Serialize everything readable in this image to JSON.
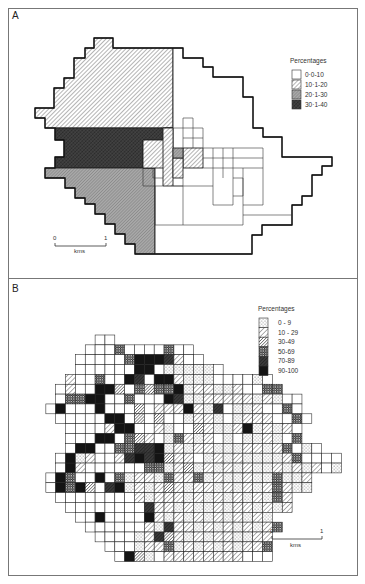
{
  "figure": {
    "panel_a": {
      "label": "A",
      "legend": {
        "title": "Percentages",
        "items": [
          {
            "label": "0·0-10",
            "pattern": "white"
          },
          {
            "label": "10·1-20",
            "pattern": "hatch-light"
          },
          {
            "label": "20·1-30",
            "pattern": "gray"
          },
          {
            "label": "30·1-40",
            "pattern": "dark"
          }
        ]
      },
      "scale": {
        "start": "0",
        "end": "1",
        "unit": "kms"
      },
      "regions": [
        {
          "class": "hatch-light",
          "points": "94,38 113,38 113,48 173,48 173,128 45,128 45,118 35,118 35,108 54,108 54,88 64,88 64,78 74,78 74,58 85,58 85,48 94,48"
        },
        {
          "class": "dark",
          "points": "55,128 165,128 165,168 55,168 55,157 64,157 64,140 55,140"
        },
        {
          "class": "gray",
          "points": "45,168 155,168 155,254 135,254 135,244 125,244 125,234 115,234 115,224 105,224 105,214 95,214 95,204 85,204 85,198 75,198 75,188 65,188 65,178 55,178 55,178 45,178"
        },
        {
          "class": "white",
          "points": "173,48 183,48 183,58 203,58 203,67 213,67 213,77 243,77 243,97 253,97 253,128 263,128 263,137 282,137 282,157 332,157 332,166 322,166 322,175 312,175 312,196 302,196 302,205 292,205 292,225 262,225 262,235 252,235 252,254 155,254 155,168 143,168 143,140 165,140 165,128 173,128"
        },
        {
          "class": "hatch-light",
          "points": "143,140 165,140 165,128 173,128 173,168 143,168"
        },
        {
          "class": "hatch-light",
          "points": "163,128 173,128 173,186 163,186"
        },
        {
          "class": "hatch-light",
          "points": "183,148 203,148 203,168 183,168"
        },
        {
          "class": "hatch-light",
          "points": "173,158 183,158 183,178 173,178"
        },
        {
          "class": "gray",
          "points": "173,148 183,148 183,158 173,158"
        }
      ],
      "lines": [
        "183,118 183,148",
        "183,118 193,118 193,148",
        "173,128 203,128",
        "183,138 203,138",
        "203,128 203,148",
        "203,148 263,148",
        "203,158 263,158",
        "203,168 213,168",
        "213,148 213,168",
        "223,148 223,178",
        "233,148 233,205",
        "263,148 263,205",
        "213,168 263,168",
        "143,168 143,186 163,186",
        "153,168 153,178 163,178",
        "183,178 183,186 173,186",
        "173,186 213,186",
        "213,168 213,205 233,205",
        "233,178 243,178 243,196 233,196",
        "243,168 243,205 263,205",
        "155,186 155,225",
        "183,186 183,225",
        "155,225 243,225",
        "243,205 243,225",
        "243,215 292,215",
        "155,254 252,254"
      ]
    },
    "panel_b": {
      "label": "B",
      "legend": {
        "title": "Percentages",
        "items": [
          {
            "label": "0 - 9",
            "code": 1
          },
          {
            "label": "10 - 29",
            "code": 2
          },
          {
            "label": "30-49",
            "code": 3
          },
          {
            "label": "50-69",
            "code": 4
          },
          {
            "label": "70-89",
            "code": 5
          },
          {
            "label": "90-100",
            "code": 6
          }
        ]
      },
      "scale": {
        "start": "0",
        "end": "1",
        "unit": "kms"
      },
      "grid": {
        "origin_x": 36,
        "origin_y": 335,
        "cell": 9.85,
        "rows": [
          "......00......................",
          ".....00040000400..............",
          "....0000046665200.............",
          "....000000660111110...........",
          "...200400650662111000010......",
          "..02006630434461221120044.....",
          "..0446600400065112222212100...",
          ".06000600030222621501120040...",
          "..00000660303001221012220040..",
          "...000026600210032112612120...",
          "...000660432014212010112104...",
          "...06600445561212211122124010.",
          "..06120025656322012121111240000",
          "..06200000044123121212112121201",
          ".064006041221422412112114112..",
          ".064630561212321221212124211..",
          "..000000002122212121212142...",
          "...00000000522121121221212...",
          "....00600006212121212121.....",
          ".....00000021522121212124....",
          "......000012532121221122.....",
          ".......00012241212121224.....",
          "........0631022222222000....."
        ]
      }
    },
    "bottom_caption": {
      "text": ""
    }
  },
  "colors": {
    "ink": "#1a1a1a",
    "frame": "#555555",
    "gray_fill": "#9a9a9a",
    "dark_fill": "#3a3a3a",
    "black_fill": "#111111",
    "paper": "#ffffff"
  }
}
